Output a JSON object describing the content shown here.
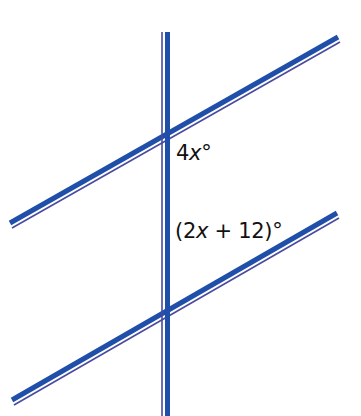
{
  "diagram": {
    "colors": {
      "line_main": "#1f4fa8",
      "line_shadow": "#4a4aa0",
      "text": "#111111"
    },
    "lines": {
      "transversal": {
        "x": 167,
        "y1": 32,
        "y2": 416
      },
      "upper_parallel": {
        "x1": 10,
        "y1": 224,
        "x2": 338,
        "y2": 38
      },
      "lower_parallel": {
        "x1": 12,
        "y1": 401,
        "x2": 337,
        "y2": 214
      }
    },
    "angle_labels": [
      {
        "id": "upper",
        "prefix": "4",
        "variable": "x",
        "suffix": "°"
      },
      {
        "id": "lower",
        "prefix": "(2",
        "variable": "x",
        "suffix": " + 12)°"
      }
    ]
  }
}
